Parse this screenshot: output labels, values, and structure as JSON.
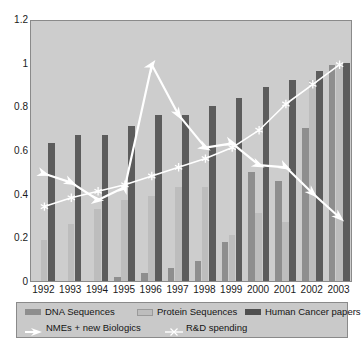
{
  "chart_data": {
    "type": "bar",
    "title": "",
    "subtitle": "",
    "xlabel": "",
    "ylabel": "",
    "ylim": [
      0,
      1.2
    ],
    "yticks": [
      "0",
      "0.2",
      "0.4",
      "0.6",
      "0.8",
      "1",
      "1.2"
    ],
    "ytick_values": [
      0,
      0.2,
      0.4,
      0.6,
      0.8,
      1,
      1.2
    ],
    "grid": false,
    "legend_position": "bottom",
    "categories": [
      "1992",
      "1993",
      "1994",
      "1995",
      "1996",
      "1997",
      "1998",
      "1999",
      "2000",
      "2001",
      "2002",
      "2003"
    ],
    "series": [
      {
        "name": "DNA Sequences",
        "kind": "bar",
        "color": "#8e8e8e",
        "values": [
          0.0,
          0.0,
          0.0,
          0.02,
          0.035,
          0.06,
          0.09,
          0.18,
          0.5,
          0.46,
          0.7,
          0.99
        ]
      },
      {
        "name": "Protein Sequences",
        "kind": "bar",
        "color": "#bdbdbd",
        "values": [
          0.19,
          0.26,
          0.33,
          0.37,
          0.39,
          0.43,
          0.43,
          0.21,
          0.31,
          0.27,
          0.92,
          0.99
        ]
      },
      {
        "name": "Human Cancer papers",
        "kind": "bar",
        "color": "#5c5c5c",
        "values": [
          0.63,
          0.67,
          0.67,
          0.71,
          0.76,
          0.76,
          0.8,
          0.84,
          0.89,
          0.92,
          0.96,
          1.0
        ]
      },
      {
        "name": "NMEs + new Biologics",
        "kind": "line",
        "color": "#ffffff",
        "marker": "arrow",
        "values": [
          0.5,
          0.46,
          0.38,
          0.44,
          1.0,
          0.77,
          0.62,
          0.64,
          0.54,
          0.53,
          0.41,
          0.3
        ]
      },
      {
        "name": "R&D spending",
        "kind": "line",
        "color": "#ffffff",
        "marker": "star",
        "values": [
          0.35,
          0.39,
          0.42,
          0.45,
          0.49,
          0.53,
          0.57,
          0.62,
          0.7,
          0.82,
          0.91,
          1.0
        ]
      }
    ]
  },
  "legend": {
    "row1": [
      {
        "label": "DNA Sequences",
        "swatch": "dna"
      },
      {
        "label": "Protein Sequences",
        "swatch": "protein"
      },
      {
        "label": "Human Cancer papers",
        "swatch": "cancer"
      }
    ],
    "row2": [
      {
        "label": "NMEs + new Biologics",
        "swatch": "arrow-marker-icon"
      },
      {
        "label": "R&D spending",
        "swatch": "star-marker-icon"
      }
    ]
  },
  "colors": {
    "plot_background": "#cdcdcd",
    "page_background": "#ffffff",
    "legend_background": "#c9c9c9",
    "axis": "#8a8a8a",
    "dna": "#8e8e8e",
    "protein": "#bdbdbd",
    "cancer": "#5c5c5c",
    "line": "#ffffff"
  }
}
